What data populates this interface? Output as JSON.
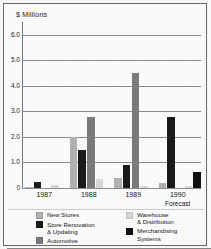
{
  "chart_data": {
    "type": "bar",
    "title": "",
    "ylabel": "$ Millions",
    "xlabel": "",
    "ylim": [
      0,
      6.5
    ],
    "yticks": [
      "0",
      "1.0",
      "2.0",
      "3.0",
      "4.0",
      "5.0",
      "6.0"
    ],
    "ytick_values": [
      0,
      1.0,
      2.0,
      3.0,
      4.0,
      5.0,
      6.0
    ],
    "grid": true,
    "grid_axis": "y",
    "legend_position": "bottom",
    "categories": [
      "1987",
      "1988",
      "1989",
      "1990"
    ],
    "category_sublabels": [
      "",
      "",
      "",
      "Forecast"
    ],
    "series": [
      {
        "name": "New Stores",
        "color": "#b4b4b4",
        "values": [
          0.05,
          2.0,
          0.4,
          0.2
        ]
      },
      {
        "name": "Store Renovation\n& Updating",
        "color": "#1b1b1b",
        "values": [
          0.22,
          1.5,
          0.9,
          2.8
        ]
      },
      {
        "name": "Automotive",
        "color": "#7d7d7d",
        "values": [
          0.0,
          2.8,
          4.5,
          0.0
        ]
      },
      {
        "name": "Warehouse\n& Distribution",
        "color": "#dcdcdc",
        "values": [
          0.1,
          0.35,
          0.06,
          0.07
        ]
      },
      {
        "name": "Merchandising\nSystems",
        "color": "#111111",
        "values": [
          0.0,
          0.0,
          0.0,
          0.62
        ]
      }
    ]
  },
  "legend": {
    "left_column": [
      {
        "label": "New Stores",
        "color": "#b4b4b4"
      },
      {
        "label": "Store Renovation\n& Updating",
        "color": "#1b1b1b"
      },
      {
        "label": "Automotive",
        "color": "#7d7d7d"
      }
    ],
    "right_column": [
      {
        "label": "Warehouse\n& Distribution",
        "color": "#dcdcdc"
      },
      {
        "label": "Merchandising\nSystems",
        "color": "#111111"
      }
    ]
  }
}
